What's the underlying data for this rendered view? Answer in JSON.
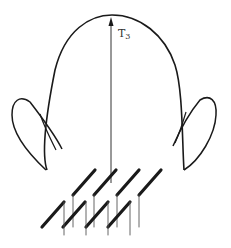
{
  "diagram": {
    "type": "antenna radiation pattern",
    "beam_label": {
      "main": "T",
      "subscript": "3"
    },
    "colors": {
      "stroke": "#1a1a1a",
      "thin_stroke": "#555555",
      "background": "#ffffff"
    },
    "components": [
      "main-lobe",
      "left-side-lobe",
      "right-side-lobe",
      "beam-direction-arrow",
      "antenna-array"
    ],
    "array": {
      "rows": 2,
      "columns": 4
    }
  }
}
